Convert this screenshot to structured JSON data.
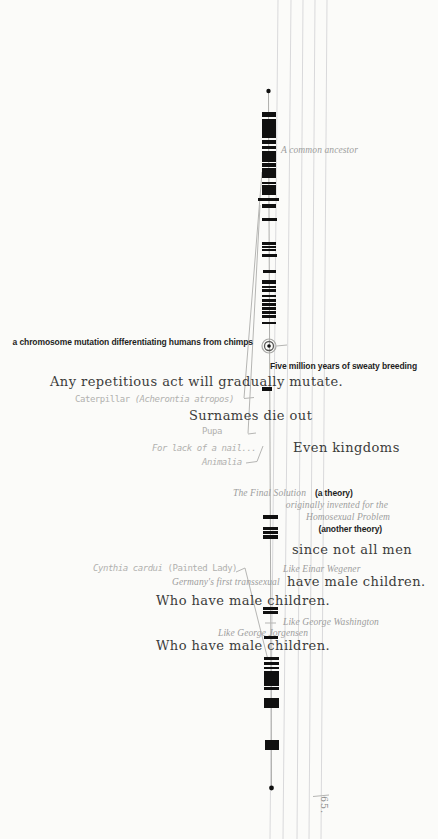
{
  "page": {
    "number": "65.",
    "background": "#fbfbf9"
  },
  "colors": {
    "band": "#101010",
    "ruled_line": "#d9d9db",
    "leader": "#b5b5b3",
    "center_line": "#9a9a98",
    "body_text": "#3b3b3b",
    "bold_text": "#1e1e1e",
    "italic_label": "#9d9d9d",
    "hand_label": "#b1b1af"
  },
  "labels": {
    "common_ancestor": "A common ancestor",
    "chromosome_mutation": "a chromosome mutation differentiating humans from chimps",
    "five_million_years": "Five million years of sweaty breeding",
    "any_repetitious": "Any repetitious act will gradually mutate.",
    "caterpillar_common": "Caterpillar ",
    "caterpillar_latin": "(Acherontia atropos)",
    "surnames_die_out": "Surnames die out",
    "pupa": "Pupa",
    "for_lack_of_a_nail": "For lack of a nail...",
    "even_kingdoms": "Even kingdoms",
    "animalia": "Animalia",
    "the_final_solution": "The Final Solution",
    "a_theory": "(a theory)",
    "originally_invented": "originally invented for the",
    "homosexual_problem": "Homosexual Problem",
    "another_theory": "(another theory)",
    "since_not_all_men": "since not all men",
    "cynthia_latin": "Cynthia cardui ",
    "cynthia_common": "(Painted Lady)",
    "like_einar_wegener": "Like Einar Wegener",
    "germanys_first_transsexual": "Germany's first transsexual",
    "have_male_children": "have male children.",
    "who_have_male_children_1": "Who have male children.",
    "like_george_washington": "Like George Washington",
    "like_george_jorgensen": "Like George Jorgensen",
    "who_have_male_children_2": "Who have male children."
  },
  "diagram": {
    "center_line": {
      "x1": 268.5,
      "y1": 93,
      "x2": 271.5,
      "y2": 786
    },
    "top_dot": {
      "x": 268.5,
      "y": 91,
      "r": 2.2
    },
    "bottom_dot": {
      "x": 271.5,
      "y": 788,
      "r": 2.4
    },
    "marker_circle": {
      "cx": 269,
      "cy": 346,
      "r_outer": 7,
      "r_inner": 4.5,
      "r_dot": 1.8
    },
    "ruled_lines": [
      {
        "x1": 278,
        "x2": 270
      },
      {
        "x1": 291,
        "x2": 283
      },
      {
        "x1": 303,
        "x2": 297
      },
      {
        "x1": 315,
        "x2": 309
      },
      {
        "x1": 327,
        "x2": 321
      }
    ],
    "bands": [
      [
        112,
        5,
        14,
        269
      ],
      [
        119,
        19,
        14,
        269
      ],
      [
        140,
        4,
        14,
        269
      ],
      [
        146,
        3,
        14,
        269
      ],
      [
        151,
        11,
        14,
        269
      ],
      [
        163,
        4,
        14,
        269
      ],
      [
        168,
        10,
        14,
        269
      ],
      [
        182,
        2,
        14,
        269
      ],
      [
        185,
        10,
        14,
        269
      ],
      [
        198,
        2.5,
        21,
        268
      ],
      [
        203.5,
        4,
        14,
        269
      ],
      [
        217.5,
        3,
        15,
        269
      ],
      [
        242,
        3,
        14,
        269
      ],
      [
        246,
        2,
        14,
        269
      ],
      [
        249,
        2,
        14,
        269
      ],
      [
        254,
        3,
        15,
        269
      ],
      [
        269.5,
        3,
        13,
        269
      ],
      [
        280,
        3.5,
        14,
        269
      ],
      [
        285.5,
        2,
        14,
        269
      ],
      [
        289,
        3,
        14,
        269
      ],
      [
        295,
        2,
        14,
        269
      ],
      [
        298.5,
        3,
        14,
        269
      ],
      [
        302.5,
        3,
        14,
        269
      ],
      [
        306.5,
        3,
        14,
        269
      ],
      [
        310.5,
        3,
        14,
        269
      ],
      [
        315,
        2.5,
        14,
        269
      ],
      [
        322,
        2,
        14,
        269
      ],
      [
        386.5,
        4,
        10,
        267
      ],
      [
        514.5,
        4,
        15,
        270
      ],
      [
        527,
        2.5,
        15,
        270
      ],
      [
        531,
        3,
        15,
        270
      ],
      [
        535,
        3.5,
        15,
        270
      ],
      [
        606.5,
        3,
        15,
        270
      ],
      [
        611,
        3,
        15,
        270
      ],
      [
        636,
        3,
        14,
        271
      ],
      [
        657,
        3,
        15,
        271
      ],
      [
        662,
        3,
        15,
        271
      ],
      [
        667,
        2,
        15,
        271
      ],
      [
        670.5,
        15,
        15,
        271
      ],
      [
        686.5,
        3,
        15,
        271
      ],
      [
        698,
        10,
        15,
        271.5
      ],
      [
        740,
        10,
        14,
        271.5
      ]
    ],
    "leaders": [
      [
        262,
        172,
        244,
        398
      ],
      [
        244,
        398.5,
        254,
        397.5
      ],
      [
        260,
        205,
        248,
        433.5
      ],
      [
        248,
        434,
        256,
        433
      ],
      [
        257,
        461.5,
        263,
        446
      ],
      [
        246,
        463,
        257,
        461.5
      ],
      [
        236,
        572,
        245,
        568
      ],
      [
        245,
        568,
        268,
        660
      ],
      [
        276.5,
        346,
        287,
        345
      ],
      [
        265,
        623,
        276,
        623
      ],
      [
        313,
        796.5,
        329,
        795
      ]
    ]
  }
}
